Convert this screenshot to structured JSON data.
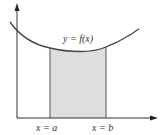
{
  "diagram": {
    "type": "area-under-curve",
    "curve_label": "y = f(x)",
    "lower_bound_label": "x = a",
    "upper_bound_label": "x = b",
    "colors": {
      "axis": "#333333",
      "curve": "#444444",
      "region_fill": "#dedede",
      "region_edge": "#555555",
      "background": "#ffffff"
    },
    "axes": {
      "x_axis": {
        "direction": "right",
        "has_arrow": true
      },
      "y_axis": {
        "direction": "up",
        "has_arrow": true
      }
    },
    "shaded_region": {
      "description": "Area under y = f(x) between x = a and x = b"
    }
  }
}
